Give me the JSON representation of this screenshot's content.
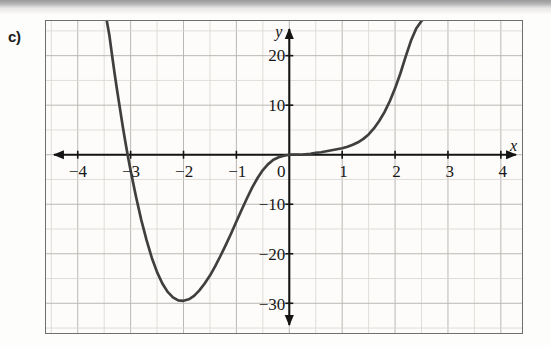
{
  "figure": {
    "problem_label": "c)",
    "axis_labels": {
      "x": "x",
      "y": "y"
    }
  },
  "chart_data": {
    "type": "line",
    "title": "",
    "xlabel": "x",
    "ylabel": "y",
    "xlim": [
      -4.6,
      4.4
    ],
    "ylim": [
      -36,
      27
    ],
    "grid": true,
    "legend": "none",
    "x_ticks": [
      -4,
      -3,
      -2,
      -1,
      0,
      1,
      2,
      3,
      4
    ],
    "x_tick_labels": [
      "-4",
      "-3",
      "-2",
      "-1",
      "0",
      "1",
      "2",
      "3",
      "4"
    ],
    "y_ticks": [
      20,
      10,
      -10,
      -20,
      -30
    ],
    "y_tick_labels": [
      "20",
      "10",
      "-10",
      "-20",
      "-30"
    ],
    "grid_step_x": 0.5,
    "grid_step_y": 5,
    "x_axis_arrows": [
      "left",
      "right"
    ],
    "y_axis_arrows": [
      "up",
      "down"
    ],
    "annotations": [
      {
        "text": "local minimum",
        "x": -1.9,
        "y": -29
      },
      {
        "text": "x-intercept",
        "x": -3.1,
        "y": 0
      },
      {
        "text": "x-intercept",
        "x": 1.5,
        "y": 0
      },
      {
        "text": "inflection near origin",
        "x": 0,
        "y": -1
      }
    ],
    "series": [
      {
        "name": "curve",
        "color": "#3f3f3f",
        "x": [
          -3.45,
          -3.4,
          -3.35,
          -3.3,
          -3.25,
          -3.2,
          -3.15,
          -3.1,
          -3.05,
          -3.0,
          -2.9,
          -2.8,
          -2.7,
          -2.6,
          -2.5,
          -2.4,
          -2.3,
          -2.2,
          -2.1,
          -2.0,
          -1.9,
          -1.8,
          -1.7,
          -1.6,
          -1.5,
          -1.4,
          -1.3,
          -1.2,
          -1.1,
          -1.0,
          -0.9,
          -0.8,
          -0.7,
          -0.6,
          -0.5,
          -0.4,
          -0.3,
          -0.2,
          -0.1,
          0.0,
          0.1,
          0.2,
          0.3,
          0.4,
          0.5,
          0.6,
          0.7,
          0.8,
          0.9,
          1.0,
          1.1,
          1.2,
          1.3,
          1.4,
          1.5,
          1.6,
          1.7,
          1.8,
          1.9,
          2.0,
          2.1,
          2.2,
          2.3,
          2.4,
          2.5,
          2.55,
          2.6,
          2.65
        ],
        "y": [
          27.0,
          24.0,
          20.0,
          16.2,
          12.6,
          9.2,
          5.8,
          2.6,
          -0.4,
          -3.2,
          -8.4,
          -13.1,
          -17.2,
          -20.8,
          -23.7,
          -26.0,
          -27.7,
          -28.8,
          -29.4,
          -29.5,
          -29.2,
          -28.5,
          -27.4,
          -26.0,
          -24.4,
          -22.5,
          -20.4,
          -18.2,
          -15.9,
          -13.5,
          -11.1,
          -8.8,
          -6.6,
          -4.7,
          -3.1,
          -1.9,
          -1.0,
          -0.5,
          -0.2,
          0.0,
          0.0,
          0.0,
          0.1,
          0.2,
          0.4,
          0.5,
          0.7,
          0.9,
          1.1,
          1.3,
          1.6,
          2.0,
          2.5,
          3.2,
          4.1,
          5.3,
          6.8,
          8.6,
          10.8,
          13.4,
          16.4,
          19.8,
          23.0,
          25.5,
          27.0,
          27.5,
          28.0,
          28.3
        ]
      }
    ]
  }
}
